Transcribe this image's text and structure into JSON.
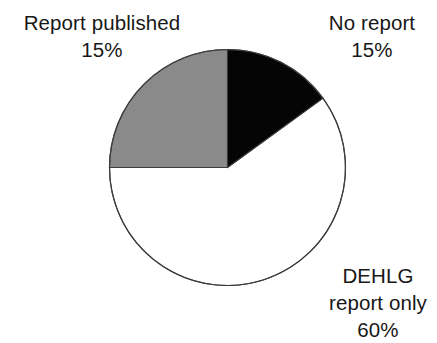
{
  "chart_data": {
    "type": "pie",
    "title": "",
    "subtitle": "",
    "xlabel": "",
    "ylabel": "",
    "legend_position": "none",
    "grid": false,
    "start_angle_deg": 0,
    "direction": "clockwise",
    "categories": [
      "No report",
      "DEHLG report only",
      "Report published"
    ],
    "values": [
      15,
      60,
      15
    ],
    "value_labels": [
      "15%",
      "60%",
      "15%"
    ],
    "units": "percent",
    "total": 100,
    "slices": [
      {
        "name": "No report",
        "label_lines": [
          "No report",
          "15%"
        ],
        "value": 15,
        "value_label": "15%",
        "start_angle_deg": 0,
        "end_angle_deg": 54,
        "fill": "#050505",
        "stroke": "#3d3d3d",
        "label_position": "top-right"
      },
      {
        "name": "DEHLG report only",
        "label_lines": [
          "DEHLG",
          "report only",
          "60%"
        ],
        "value": 60,
        "value_label": "60%",
        "start_angle_deg": 54,
        "end_angle_deg": 270,
        "fill": "#ffffff",
        "stroke": "#3d3d3d",
        "label_position": "bottom-right"
      },
      {
        "name": "Report published",
        "label_lines": [
          "Report published",
          "15%"
        ],
        "value": 15,
        "value_label": "15%",
        "start_angle_deg": 270,
        "end_angle_deg": 360,
        "fill": "#8a8a8a",
        "stroke": "#3d3d3d",
        "label_position": "top-left"
      }
    ],
    "geometry": {
      "center_x": 227.5,
      "center_y": 167.5,
      "radius": 118
    },
    "colors": {
      "background": "#ffffff",
      "text": "#181818",
      "slice_no_report": "#050505",
      "slice_dehlg_report_only": "#ffffff",
      "slice_report_published": "#8a8a8a",
      "outline": "#3d3d3d"
    }
  },
  "labels": {
    "report_published": {
      "line1": "Report published",
      "line2": "15%"
    },
    "no_report": {
      "line1": "No report",
      "line2": "15%"
    },
    "dehlg": {
      "line1": "DEHLG",
      "line2": "report only",
      "line3": "60%"
    }
  }
}
